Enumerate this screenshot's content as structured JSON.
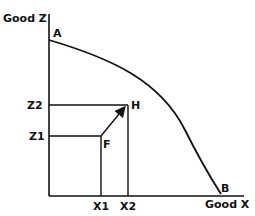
{
  "diagram": {
    "y_axis_label": "Good Z",
    "x_axis_label": "Good X",
    "curve_points": {
      "start": "A",
      "end": "B"
    },
    "points": {
      "F": "F",
      "H": "H"
    },
    "y_ticks": [
      "Z2",
      "Z1"
    ],
    "x_ticks": [
      "X1",
      "X2"
    ],
    "colors": {
      "line": "#111111",
      "background": "#ffffff"
    }
  }
}
